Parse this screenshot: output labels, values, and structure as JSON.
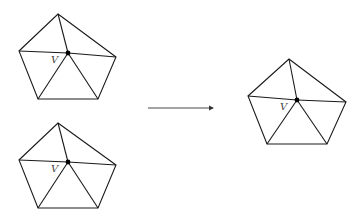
{
  "diagram": {
    "vertex_label": "V",
    "colors": {
      "edge": "#1a1a1a",
      "dot": "#000000",
      "label": "#444444",
      "arrow": "#333333"
    },
    "shapes": [
      {
        "name": "pentagon-top-left",
        "outer": [
          [
            58,
            14
          ],
          [
            116,
            57
          ],
          [
            98,
            99
          ],
          [
            38,
            99
          ],
          [
            19,
            51
          ]
        ],
        "center": [
          68,
          53
        ],
        "label_pos": [
          51,
          63
        ]
      },
      {
        "name": "pentagon-bottom-left",
        "outer": [
          [
            58,
            123
          ],
          [
            116,
            165
          ],
          [
            98,
            208
          ],
          [
            38,
            208
          ],
          [
            19,
            160
          ]
        ],
        "center": [
          68,
          162
        ],
        "label_pos": [
          51,
          172
        ]
      },
      {
        "name": "pentagon-right",
        "outer": [
          [
            289,
            59
          ],
          [
            346,
            102
          ],
          [
            327,
            144
          ],
          [
            267,
            144
          ],
          [
            248,
            96
          ]
        ],
        "center": [
          297,
          100
        ],
        "label_pos": [
          280,
          110
        ]
      }
    ],
    "arrow": {
      "from": [
        148,
        108
      ],
      "to": [
        213,
        108
      ]
    }
  }
}
